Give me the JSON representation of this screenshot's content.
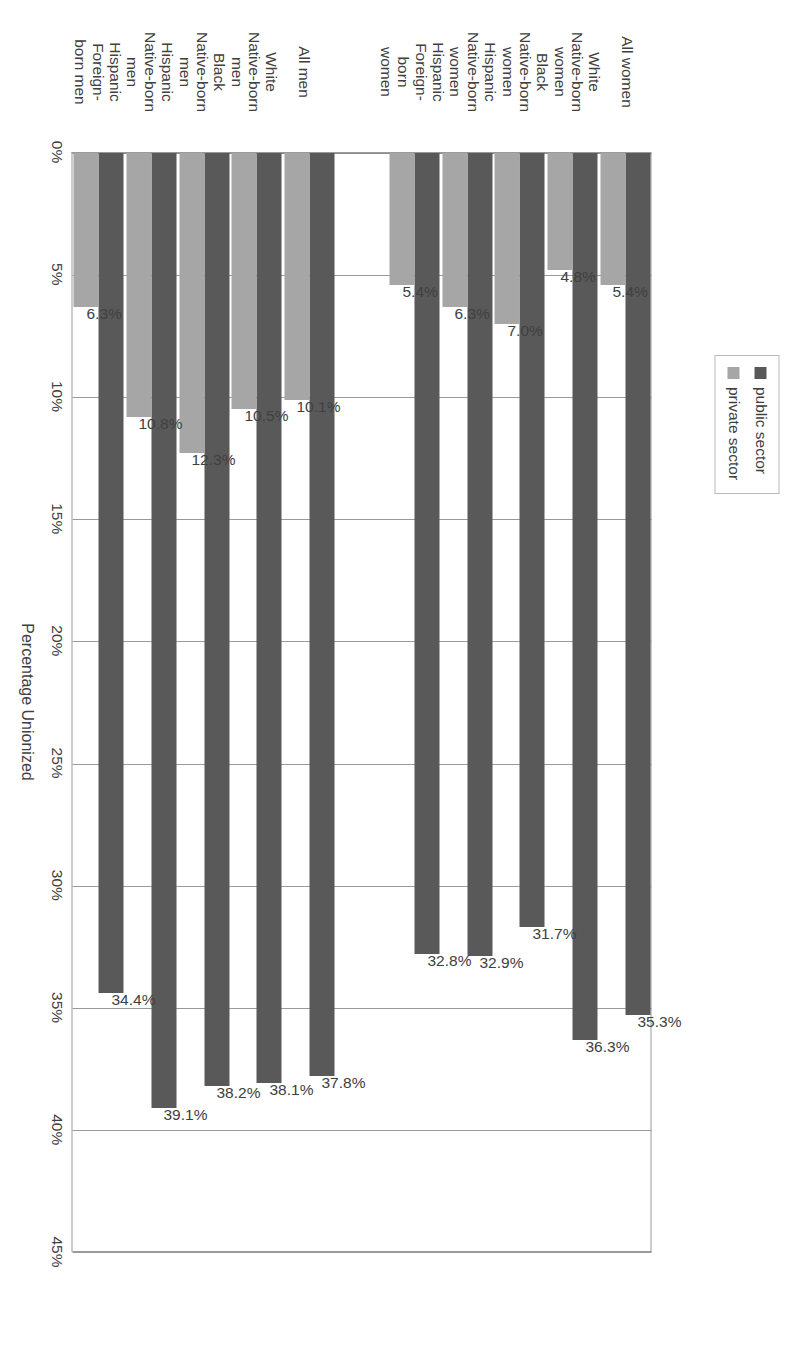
{
  "chart_data": {
    "type": "bar",
    "orientation": "horizontal",
    "title": "",
    "xlabel": "Percentage Unionized",
    "ylabel": "",
    "xlim": [
      0,
      45
    ],
    "xticks": [
      "0%",
      "5%",
      "10%",
      "15%",
      "20%",
      "25%",
      "30%",
      "35%",
      "40%",
      "45%"
    ],
    "xtick_values": [
      0,
      5,
      10,
      15,
      20,
      25,
      30,
      35,
      40,
      45
    ],
    "grid": true,
    "legend_position": "top",
    "legend": [
      "public sector",
      "private sector"
    ],
    "categories": [
      "All women",
      "White Native-born women",
      "Black Native-born women",
      "Hispanic Native-born women",
      "Hispanic Foreign-born women",
      "",
      "All men",
      "White Native-born men",
      "Black Native-born men",
      "Hispanic Native-born men",
      "Hispanic Foreign-born men"
    ],
    "series": [
      {
        "name": "public sector",
        "color": "#595959",
        "values": [
          35.3,
          36.3,
          31.7,
          32.9,
          32.8,
          null,
          37.8,
          38.1,
          38.2,
          39.1,
          34.4
        ],
        "labels": [
          "35.3%",
          "36.3%",
          "31.7%",
          "32.9%",
          "32.8%",
          "",
          "37.8%",
          "38.1%",
          "38.2%",
          "39.1%",
          "34.4%"
        ]
      },
      {
        "name": "private sector",
        "color": "#a6a6a6",
        "values": [
          5.4,
          4.8,
          7.0,
          6.3,
          5.4,
          null,
          10.1,
          10.5,
          12.3,
          10.8,
          6.3
        ],
        "labels": [
          "5.4%",
          "4.8%",
          "7.0%",
          "6.3%",
          "5.4%",
          "",
          "10.1%",
          "10.5%",
          "12.3%",
          "10.8%",
          "6.3%"
        ]
      }
    ]
  },
  "legend": {
    "items": [
      {
        "label": "public sector",
        "color": "#595959"
      },
      {
        "label": "private sector",
        "color": "#a6a6a6"
      }
    ]
  },
  "axis": {
    "value_axis_title": "Percentage Unionized"
  },
  "category_lines": [
    [
      "All women"
    ],
    [
      "White",
      "Native-born",
      "women"
    ],
    [
      "Black",
      "Native-born",
      "women"
    ],
    [
      "Hispanic",
      "Native-born",
      "women"
    ],
    [
      "Hispanic",
      "Foreign-",
      "born",
      "women"
    ],
    [
      ""
    ],
    [
      "All men"
    ],
    [
      "White",
      "Native-born",
      "men"
    ],
    [
      "Black",
      "Native-born",
      "men"
    ],
    [
      "Hispanic",
      "Native-born",
      "men"
    ],
    [
      "Hispanic",
      "Foreign-",
      "born men"
    ]
  ]
}
